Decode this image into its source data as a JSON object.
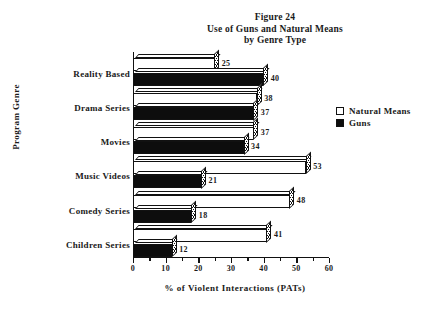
{
  "figure": {
    "title_lines": [
      "Figure 24",
      "Use of Guns and Natural Means",
      "by Genre Type"
    ]
  },
  "legend": {
    "position": "right",
    "entries": [
      {
        "label": "Natural Means",
        "swatch": "white-square",
        "color": "#ffffff"
      },
      {
        "label": "Guns",
        "swatch": "black-square",
        "color": "#0d0d0d"
      }
    ]
  },
  "axes": {
    "x_title": "% of Violent Interactions (PATs)",
    "y_title": "Program Genre",
    "x_ticks": [
      "0",
      "10",
      "20",
      "30",
      "40",
      "50",
      "60"
    ]
  },
  "chart_data": {
    "type": "bar",
    "orientation": "horizontal",
    "xlabel": "% of Violent Interactions (PATs)",
    "ylabel": "Program Genre",
    "xlim": [
      0,
      60
    ],
    "xticks": [
      0,
      10,
      20,
      30,
      40,
      50,
      60
    ],
    "minor_tick_step": 5,
    "grid": false,
    "legend_position": "right",
    "categories": [
      "Reality Based",
      "Drama Series",
      "Movies",
      "Music Videos",
      "Comedy  Series",
      "Children Series"
    ],
    "series": [
      {
        "name": "Natural Means",
        "color": "#ffffff",
        "values": [
          25,
          38,
          37,
          53,
          48,
          41
        ]
      },
      {
        "name": "Guns",
        "color": "#0d0d0d",
        "values": [
          40,
          37,
          34,
          21,
          18,
          12
        ]
      }
    ]
  }
}
